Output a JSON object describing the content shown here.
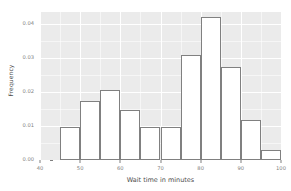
{
  "chart_data": {
    "type": "bar",
    "title": "",
    "xlabel": "Wait time in minutes",
    "ylabel": "Frequency",
    "xlim": [
      40,
      100
    ],
    "ylim": [
      0,
      0.0435
    ],
    "grid": true,
    "legend": null,
    "bin_width": 5,
    "bin_starts": [
      45,
      50,
      55,
      60,
      65,
      70,
      75,
      80,
      85,
      90,
      95
    ],
    "categories": [
      "45-50",
      "50-55",
      "55-60",
      "60-65",
      "65-70",
      "70-75",
      "75-80",
      "80-85",
      "85-90",
      "90-95",
      "95-100"
    ],
    "values": [
      0.0098,
      0.0173,
      0.0205,
      0.0148,
      0.0098,
      0.0098,
      0.0309,
      0.0421,
      0.0273,
      0.0118,
      0.003
    ],
    "x_ticks": [
      {
        "value": 40,
        "label": "40"
      },
      {
        "value": 50,
        "label": "50"
      },
      {
        "value": 60,
        "label": "60"
      },
      {
        "value": 70,
        "label": "70"
      },
      {
        "value": 80,
        "label": "80"
      },
      {
        "value": 90,
        "label": "90"
      },
      {
        "value": 100,
        "label": "100"
      }
    ],
    "y_ticks": [
      {
        "value": 0.0,
        "label": "0.00"
      },
      {
        "value": 0.01,
        "label": "0.01"
      },
      {
        "value": 0.02,
        "label": "0.02"
      },
      {
        "value": 0.03,
        "label": "0.03"
      },
      {
        "value": 0.04,
        "label": "0.04"
      }
    ],
    "colors": {
      "panel_background": "#ebebeb",
      "grid_line": "#ffffff",
      "bar_fill": "#ffffff",
      "bar_border": "#808080",
      "tick_label": "#7f7f7f",
      "axis_title": "#4d4d4d",
      "page_background": "#ffffff"
    }
  }
}
